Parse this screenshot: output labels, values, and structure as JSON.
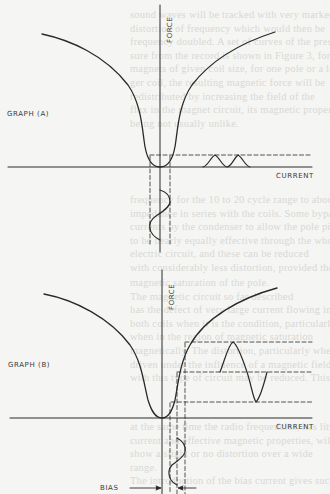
{
  "figure": {
    "graph_a": {
      "label": "GRAPH (A)",
      "y_axis_label": "FORCE",
      "x_axis_label": "CURRENT"
    },
    "graph_b": {
      "label": "GRAPH (B)",
      "y_axis_label": "FORCE",
      "x_axis_label": "CURRENT",
      "bias_label": "BIAS"
    }
  },
  "background_text": {
    "block_a": [
      "sound waves will be tracked with very marked",
      "distortion of frequency which would then be",
      "frequency doubled. A set of curves of the pres-",
      "sure from the record is shown in Figure 3, for",
      "magnets of given coil size, for one pole or a lar-",
      "ger coil, the resulting magnetic force will be",
      "redistributed by increasing the field of the",
      "flux in the magnet circuit, its magnetic properties",
      "being not usually unlike."
    ],
    "block_b": [
      "frequency for the 10 to 20 cycle range to about",
      "impedance in series with the coils. Some bypassed",
      "currents by the condenser to allow the pole piece",
      "to be nearly equally effective through the whole",
      "electric circuit, and these can be reduced",
      "with considerably less distortion, provided the"
    ],
    "block_c": [
      "magnetic saturation of the pole.",
      "The magnetic circuit so far described",
      "has the defect of very large current flowing in",
      "both coils when it is the condition, particularly",
      "when in the region of magnetic saturation",
      "magnetically. The distortion, particularly when",
      "driven under the influence of a magnetic field",
      "with this type of circuit may be reduced. This may"
    ],
    "block_d": [
      "at the same time the radio frequencies, has little",
      "current and effective magnetic properties, will",
      "show a slight or no distortion over a wide",
      "range.",
      "The introduction of the bias current gives such"
    ]
  }
}
